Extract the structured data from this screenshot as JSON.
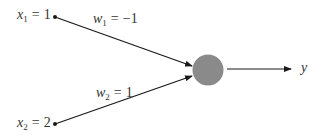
{
  "diagram": {
    "type": "single-neuron / perceptron",
    "inputs": [
      {
        "var": "x",
        "sub": "1",
        "eq": "=",
        "value": "1"
      },
      {
        "var": "x",
        "sub": "2",
        "eq": "=",
        "value": "2"
      }
    ],
    "weights": [
      {
        "var": "w",
        "sub": "1",
        "eq": "=",
        "value": "−1"
      },
      {
        "var": "w",
        "sub": "2",
        "eq": "=",
        "value": "1"
      }
    ],
    "output": {
      "var": "y"
    },
    "colors": {
      "node_fill": "#8a8a8a",
      "line": "#1a1a1a",
      "text": "#333333"
    }
  }
}
